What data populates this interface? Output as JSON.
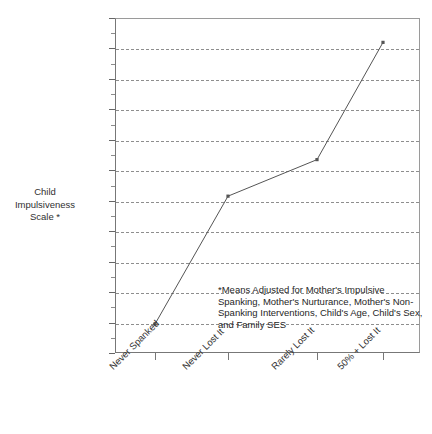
{
  "chart_data": {
    "type": "line",
    "title": "",
    "xlabel": "",
    "ylabel": "Child\nImpulsiveness\nScale *",
    "categories": [
      "Never Spanked",
      "Never Lost It",
      "Rarely Lost It",
      "50% + Lost It"
    ],
    "values": [
      41.9,
      50.3,
      52.7,
      60.4
    ],
    "series": [
      {
        "name": "Child Impulsiveness Scale",
        "values": [
          41.9,
          50.3,
          52.7,
          60.4
        ]
      }
    ],
    "ylim": [
      40,
      62
    ],
    "ytick_step": 2,
    "yticks": [
      40,
      42,
      44,
      46,
      48,
      50,
      52,
      54,
      56,
      58,
      60,
      62
    ],
    "ytick_labels": [
      "40",
      "42",
      "44",
      "46",
      "48",
      "50",
      "52",
      "54",
      "56",
      "58",
      "60",
      "62"
    ],
    "grid": true,
    "grid_style": "dashed",
    "grid_axis": "y",
    "legend": "none",
    "marker": "square",
    "line_color": "#555555",
    "grid_color": "#8e8e8e",
    "axis_color": "#777777",
    "background_color": "#ffffff"
  },
  "annotations": {
    "footnote": "*Means Adjusted for Mother's Impulsive Spanking, Mother's Nurturance, Mother's Non-Spanking Interventions, Child's Age, Child's Sex, and Family SES"
  }
}
